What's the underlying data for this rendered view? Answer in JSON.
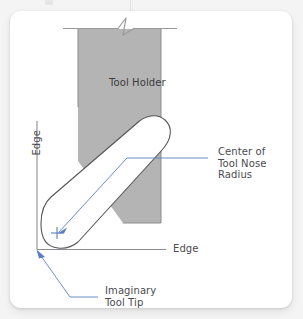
{
  "figure": {
    "title_visible": false,
    "labels": {
      "tool_holder": "Tool Holder",
      "center_of_tool_nose_radius": "Center of\nTool Nose Radius",
      "edge_vertical": "Edge",
      "edge_horizontal": "Edge",
      "imaginary_tool_tip": "Imaginary\nTool Tip"
    },
    "colors": {
      "card_background": "#ffffff",
      "page_background": "#f4f4f4",
      "tool_holder_fill": "#b4b4b4",
      "tool_holder_stroke": "#8f8f8f",
      "insert_fill": "#ffffff",
      "insert_stroke": "#55555a",
      "axis_line": "#8c8c93",
      "leader_line": "#5b7fc4",
      "text": "#4a4a4f"
    },
    "elements": {
      "break_symbol": "zigzag-break-line",
      "center_mark": "plus-crosshair",
      "leader_arrow_center": "arrow-to-center-mark",
      "leader_arrow_tip": "arrow-to-imaginary-tool-tip"
    }
  }
}
